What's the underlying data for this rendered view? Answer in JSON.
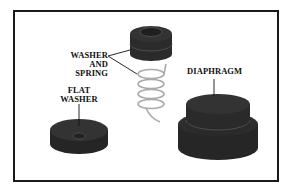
{
  "diagram": {
    "labels": {
      "washer_spring_line1": "WASHER",
      "washer_spring_line2": "AND SPRING",
      "diaphragm": "DIAPHRAGM",
      "flat_washer_line1": "FLAT",
      "flat_washer_line2": "WASHER"
    },
    "colors": {
      "part": "#2b2b2b",
      "part_top": "#3a3a3a",
      "spring": "#b8b8b8",
      "border": "#1a1a1a"
    }
  }
}
